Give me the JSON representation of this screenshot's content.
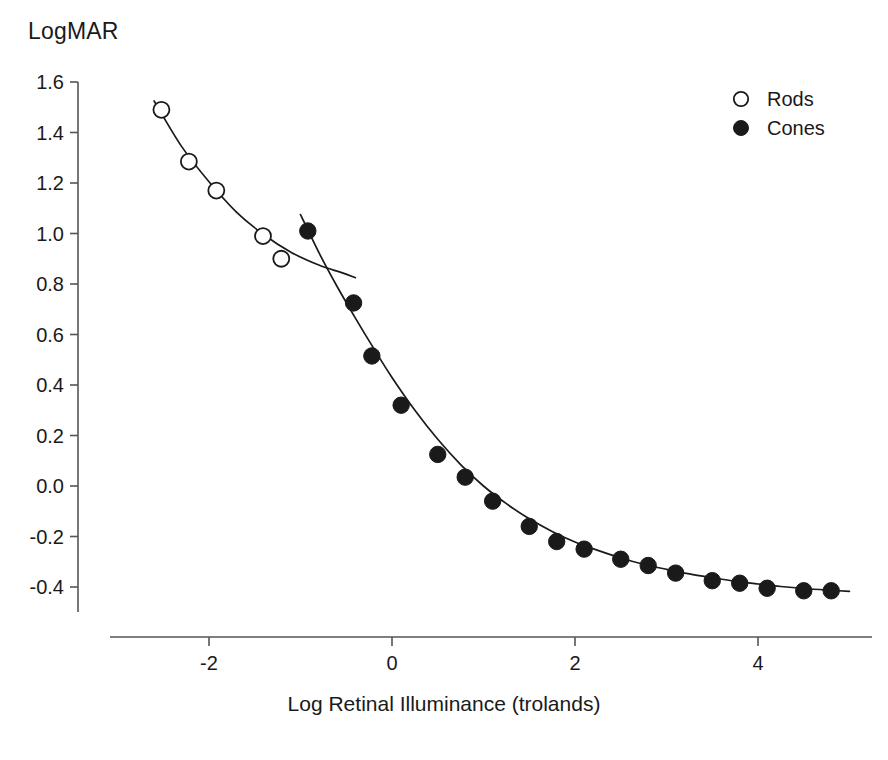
{
  "chart_data": {
    "type": "scatter",
    "title": "",
    "ylabel": "LogMAR",
    "xlabel": "Log Retinal Illuminance (trolands)",
    "xlim": [
      -2.9,
      5.1
    ],
    "ylim": [
      -0.5,
      1.65
    ],
    "xticks": [
      -2,
      0,
      2,
      4
    ],
    "xtick_labels": [
      "-2",
      "0",
      "2",
      "4"
    ],
    "yticks": [
      1.6,
      1.4,
      1.2,
      1.0,
      0.8,
      0.6,
      0.4,
      0.2,
      0.0,
      -0.2,
      -0.4
    ],
    "ytick_labels": [
      "1.6",
      "1.4",
      "1.2",
      "1.0",
      "0.8",
      "0.6",
      "0.4",
      "0.2",
      "0.0",
      "-0.2",
      "-0.4"
    ],
    "grid": false,
    "legend_position": "top-right",
    "series": [
      {
        "name": "Rods",
        "marker": "open-circle",
        "color": "#1a1a1a",
        "fill": "none",
        "points": [
          {
            "x": -2.52,
            "y": 1.49
          },
          {
            "x": -2.22,
            "y": 1.285
          },
          {
            "x": -1.92,
            "y": 1.17
          },
          {
            "x": -1.41,
            "y": 0.99
          },
          {
            "x": -1.21,
            "y": 0.9
          }
        ],
        "fit_curve": [
          {
            "x": -2.6,
            "y": 1.525
          },
          {
            "x": -2.3,
            "y": 1.345
          },
          {
            "x": -2.0,
            "y": 1.205
          },
          {
            "x": -1.7,
            "y": 1.085
          },
          {
            "x": -1.4,
            "y": 0.995
          },
          {
            "x": -1.1,
            "y": 0.925
          },
          {
            "x": -0.8,
            "y": 0.875
          },
          {
            "x": -0.55,
            "y": 0.845
          },
          {
            "x": -0.4,
            "y": 0.825
          }
        ]
      },
      {
        "name": "Cones",
        "marker": "filled-circle",
        "color": "#1a1a1a",
        "fill": "#1a1a1a",
        "points": [
          {
            "x": -0.92,
            "y": 1.01
          },
          {
            "x": -0.42,
            "y": 0.725
          },
          {
            "x": -0.22,
            "y": 0.515
          },
          {
            "x": 0.1,
            "y": 0.32
          },
          {
            "x": 0.5,
            "y": 0.125
          },
          {
            "x": 0.8,
            "y": 0.035
          },
          {
            "x": 1.1,
            "y": -0.06
          },
          {
            "x": 1.5,
            "y": -0.16
          },
          {
            "x": 1.8,
            "y": -0.22
          },
          {
            "x": 2.1,
            "y": -0.25
          },
          {
            "x": 2.5,
            "y": -0.29
          },
          {
            "x": 2.8,
            "y": -0.315
          },
          {
            "x": 3.1,
            "y": -0.345
          },
          {
            "x": 3.5,
            "y": -0.375
          },
          {
            "x": 3.8,
            "y": -0.385
          },
          {
            "x": 4.1,
            "y": -0.405
          },
          {
            "x": 4.5,
            "y": -0.415
          },
          {
            "x": 4.8,
            "y": -0.415
          }
        ],
        "fit_curve": [
          {
            "x": -1.0,
            "y": 1.075
          },
          {
            "x": -0.8,
            "y": 0.925
          },
          {
            "x": -0.6,
            "y": 0.79
          },
          {
            "x": -0.4,
            "y": 0.665
          },
          {
            "x": -0.2,
            "y": 0.545
          },
          {
            "x": 0.0,
            "y": 0.43
          },
          {
            "x": 0.25,
            "y": 0.3
          },
          {
            "x": 0.5,
            "y": 0.185
          },
          {
            "x": 0.75,
            "y": 0.085
          },
          {
            "x": 1.0,
            "y": 0.0
          },
          {
            "x": 1.25,
            "y": -0.07
          },
          {
            "x": 1.5,
            "y": -0.13
          },
          {
            "x": 1.75,
            "y": -0.18
          },
          {
            "x": 2.0,
            "y": -0.222
          },
          {
            "x": 2.25,
            "y": -0.255
          },
          {
            "x": 2.5,
            "y": -0.285
          },
          {
            "x": 2.75,
            "y": -0.31
          },
          {
            "x": 3.0,
            "y": -0.33
          },
          {
            "x": 3.25,
            "y": -0.348
          },
          {
            "x": 3.5,
            "y": -0.363
          },
          {
            "x": 3.75,
            "y": -0.377
          },
          {
            "x": 4.0,
            "y": -0.388
          },
          {
            "x": 4.25,
            "y": -0.398
          },
          {
            "x": 4.5,
            "y": -0.406
          },
          {
            "x": 4.75,
            "y": -0.412
          },
          {
            "x": 5.0,
            "y": -0.417
          }
        ]
      }
    ],
    "legend": [
      {
        "label": "Rods",
        "marker": "open-circle"
      },
      {
        "label": "Cones",
        "marker": "filled-circle"
      }
    ]
  }
}
